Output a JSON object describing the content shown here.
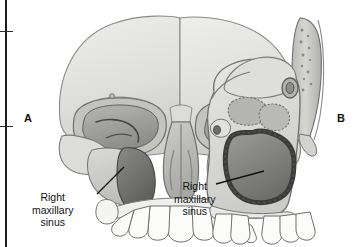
{
  "figure": {
    "background_color": "#ffffff",
    "width": 362,
    "height": 247
  },
  "edge_marks": {
    "rule_name": "left-margin-rule",
    "tick_count": 2
  },
  "panels": [
    {
      "letter": "A",
      "view": "anterior-skull-view",
      "letter_x": 24,
      "letter_y": 112,
      "callout": {
        "lines": [
          "Right",
          "maxillary",
          "sinus"
        ],
        "text_x": 32,
        "text_y": 191,
        "leader_from_x": 97,
        "leader_from_y": 194,
        "leader_to_x": 124,
        "leader_to_y": 167
      }
    },
    {
      "letter": "B",
      "view": "lateral-sagittal-skull-view",
      "letter_x": 337,
      "letter_y": 112,
      "callout": {
        "lines": [
          "Right",
          "maxillary",
          "sinus"
        ],
        "text_x": 174,
        "text_y": 180,
        "leader_from_x": 216,
        "leader_from_y": 184,
        "leader_to_x": 264,
        "leader_to_y": 171
      }
    }
  ],
  "colors": {
    "bone_light": "#e3e3e1",
    "bone_mid": "#c9c9c6",
    "bone_shadow": "#b0b0ac",
    "cavity_dark": "#6f6f6d",
    "cavity_darker": "#585856",
    "outline": "#6a6a68",
    "outline_dark": "#3f3f3e",
    "tooth_fill": "#fbfbf9",
    "leader_line": "#111111",
    "text": "#111111"
  },
  "labels": {
    "structure_name": "Right maxillary sinus"
  }
}
